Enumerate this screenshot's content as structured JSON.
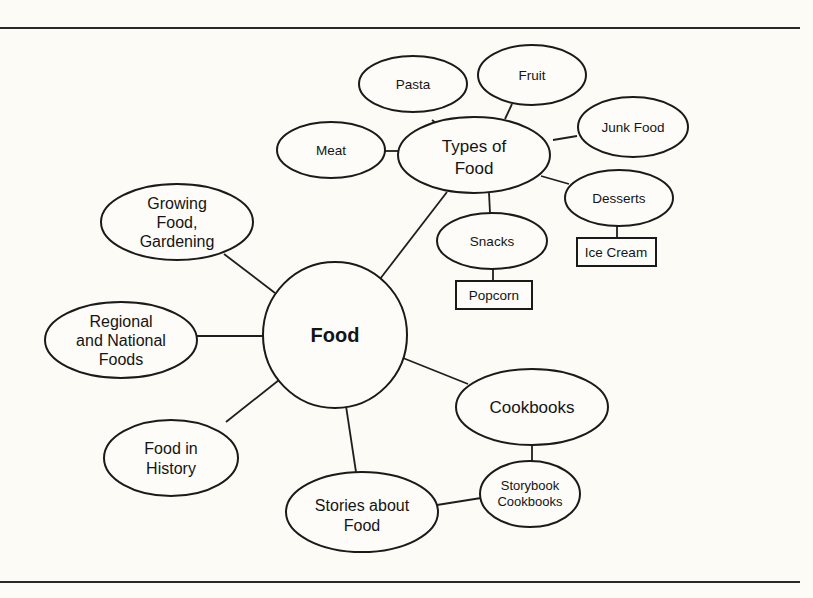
{
  "diagram": {
    "type": "concept-web",
    "central": {
      "label": "Food"
    },
    "nodes": {
      "types_of_food": {
        "lines": [
          "Types of",
          "Food"
        ]
      },
      "pasta": {
        "lines": [
          "Pasta"
        ]
      },
      "fruit": {
        "lines": [
          "Fruit"
        ]
      },
      "junk_food": {
        "lines": [
          "Junk Food"
        ]
      },
      "meat": {
        "lines": [
          "Meat"
        ]
      },
      "desserts": {
        "lines": [
          "Desserts"
        ]
      },
      "ice_cream": {
        "lines": [
          "Ice Cream"
        ]
      },
      "snacks": {
        "lines": [
          "Snacks"
        ]
      },
      "popcorn": {
        "lines": [
          "Popcorn"
        ]
      },
      "growing_food": {
        "lines": [
          "Growing",
          "Food,",
          "Gardening"
        ]
      },
      "regional": {
        "lines": [
          "Regional",
          "and National",
          "Foods"
        ]
      },
      "food_in_history": {
        "lines": [
          "Food in",
          "History"
        ]
      },
      "stories": {
        "lines": [
          "Stories about",
          "Food"
        ]
      },
      "cookbooks": {
        "lines": [
          "Cookbooks"
        ]
      },
      "storybook_cookbooks": {
        "lines": [
          "Storybook",
          "Cookbooks"
        ]
      }
    },
    "edges": [
      [
        "Food",
        "Types of Food"
      ],
      [
        "Food",
        "Growing Food, Gardening"
      ],
      [
        "Food",
        "Regional and National Foods"
      ],
      [
        "Food",
        "Food in History"
      ],
      [
        "Food",
        "Stories about Food"
      ],
      [
        "Food",
        "Cookbooks"
      ],
      [
        "Types of Food",
        "Pasta"
      ],
      [
        "Types of Food",
        "Fruit"
      ],
      [
        "Types of Food",
        "Junk Food"
      ],
      [
        "Types of Food",
        "Meat"
      ],
      [
        "Types of Food",
        "Desserts"
      ],
      [
        "Types of Food",
        "Snacks"
      ],
      [
        "Desserts",
        "Ice Cream"
      ],
      [
        "Snacks",
        "Popcorn"
      ],
      [
        "Cookbooks",
        "Storybook Cookbooks"
      ],
      [
        "Stories about Food",
        "Storybook Cookbooks"
      ]
    ]
  }
}
